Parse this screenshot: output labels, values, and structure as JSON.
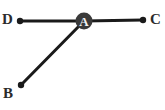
{
  "figure": {
    "type": "geometry-angle-diagram",
    "width": 165,
    "height": 110,
    "background_color": "#ffffff",
    "stroke_color": "#1a1a1a",
    "label_color": "#2b2b2b",
    "vertex_fill_color": "#3a3a3a",
    "vertex_text_color": "#f2f2f2",
    "line_width": 3,
    "endpoint_dot_radius": 3.2,
    "vertex_radius": 8.5,
    "points": [
      {
        "id": "A",
        "label": "A",
        "x": 84,
        "y": 21,
        "kind": "vertex",
        "marker": "filled-circle-with-letter"
      },
      {
        "id": "B",
        "label": "B",
        "x": 21,
        "y": 85,
        "kind": "endpoint",
        "marker": "dot",
        "label_x": 3,
        "label_y": 86
      },
      {
        "id": "C",
        "label": "C",
        "x": 143,
        "y": 20,
        "kind": "endpoint",
        "marker": "dot",
        "label_x": 150,
        "label_y": 12
      },
      {
        "id": "D",
        "label": "D",
        "x": 20,
        "y": 21,
        "kind": "endpoint",
        "marker": "dot",
        "label_x": 2,
        "label_y": 12
      }
    ],
    "segments": [
      {
        "id": "DA",
        "from": "D",
        "to": "A",
        "x1": 20,
        "y1": 21,
        "x2": 84,
        "y2": 21
      },
      {
        "id": "AC",
        "from": "A",
        "to": "C",
        "x1": 84,
        "y1": 21,
        "x2": 143,
        "y2": 20
      },
      {
        "id": "AB",
        "from": "A",
        "to": "B",
        "x1": 84,
        "y1": 21,
        "x2": 21,
        "y2": 85
      }
    ]
  }
}
